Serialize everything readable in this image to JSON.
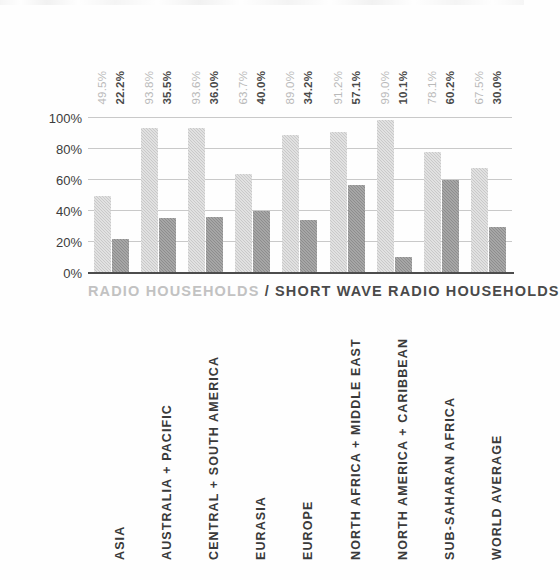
{
  "chart_data": {
    "type": "bar",
    "title": "",
    "subtitle": "",
    "xlabel": "",
    "ylabel": "",
    "ylim": [
      0,
      100
    ],
    "yticks": [
      "0%",
      "20%",
      "40%",
      "60%",
      "80%",
      "100%"
    ],
    "ytick_values": [
      0,
      20,
      40,
      60,
      80,
      100
    ],
    "grid": true,
    "legend_position": "below-plot",
    "categories": [
      "ASIA",
      "AUSTRALIA + PACIFIC",
      "CENTRAL + SOUTH AMERICA",
      "EURASIA",
      "EUROPE",
      "NORTH AFRICA + MIDDLE EAST",
      "NORTH AMERICA + CARIBBEAN",
      "SUB-SAHARAN AFRICA",
      "WORLD AVERAGE"
    ],
    "series": [
      {
        "name": "RADIO HOUSEHOLDS",
        "color": "#c9c9c9",
        "values": [
          49.5,
          93.8,
          93.6,
          63.7,
          89.0,
          91.2,
          99.0,
          78.1,
          67.5
        ],
        "labels": [
          "49.5%",
          "93.8%",
          "93.6%",
          "63.7%",
          "89.0%",
          "91.2%",
          "99.0%",
          "78.1%",
          "67.5%"
        ]
      },
      {
        "name": "SHORT WAVE RADIO HOUSEHOLDS",
        "color": "#8d8d8d",
        "values": [
          22.2,
          35.5,
          36.0,
          40.0,
          34.2,
          57.1,
          10.1,
          60.2,
          30.0
        ],
        "labels": [
          "22.2%",
          "35.5%",
          "36.0%",
          "40.0%",
          "34.2%",
          "57.1%",
          "10.1%",
          "60.2%",
          "30.0%"
        ]
      }
    ]
  },
  "legend": {
    "light_label": "RADIO HOUSEHOLDS",
    "separator": "/",
    "dark_label": "SHORT WAVE RADIO HOUSEHOLDS"
  }
}
